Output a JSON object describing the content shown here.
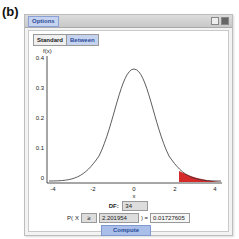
{
  "figure_label": "(b)",
  "window": {
    "title": "Options",
    "controls": [
      "restore-icon",
      "close-icon"
    ]
  },
  "tabs": [
    {
      "label": "Standard",
      "active": false
    },
    {
      "label": "Between",
      "active": true
    }
  ],
  "plot": {
    "ylabel": "f(x)",
    "xlabel": "x",
    "yticks": [
      "0.4",
      "0.3",
      "0.2",
      "0.1",
      "0"
    ],
    "xticks": [
      "-4",
      "-2",
      "0",
      "2",
      "4"
    ],
    "shaded_from": 2.201954,
    "shade_color": "#d42a2a"
  },
  "form": {
    "df_label": "DF:",
    "df_value": "34",
    "p_prefix": "P(",
    "x_label": "X",
    "operator": "≥",
    "x_value": "2.201954",
    "p_close": ") =",
    "p_result": "0.01727605",
    "compute_label": "Compute"
  }
}
